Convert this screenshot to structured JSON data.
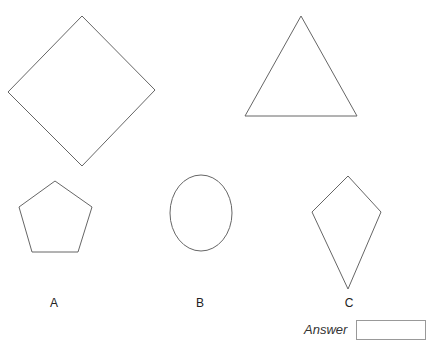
{
  "shapes": [
    {
      "id": "square",
      "type": "polygon",
      "points": "82,16 155,90 82,166 8,92"
    },
    {
      "id": "triangle",
      "type": "polygon",
      "points": "301,16 357,116 245,116"
    },
    {
      "id": "pentagon",
      "type": "polygon",
      "points": "55,181 92,207 78,252 32,252 19,207"
    },
    {
      "id": "circle",
      "type": "ellipse",
      "cx": 201,
      "cy": 213,
      "rx": 31,
      "ry": 38
    },
    {
      "id": "kite",
      "type": "polygon",
      "points": "348,176 381,212 348,289 312,212"
    }
  ],
  "stroke_color": "#666666",
  "labels": [
    {
      "text": "A",
      "x": 54,
      "y": 296
    },
    {
      "text": "B",
      "x": 200,
      "y": 296
    },
    {
      "text": "C",
      "x": 349,
      "y": 296
    }
  ],
  "answer": {
    "label": "Answer",
    "value": ""
  }
}
